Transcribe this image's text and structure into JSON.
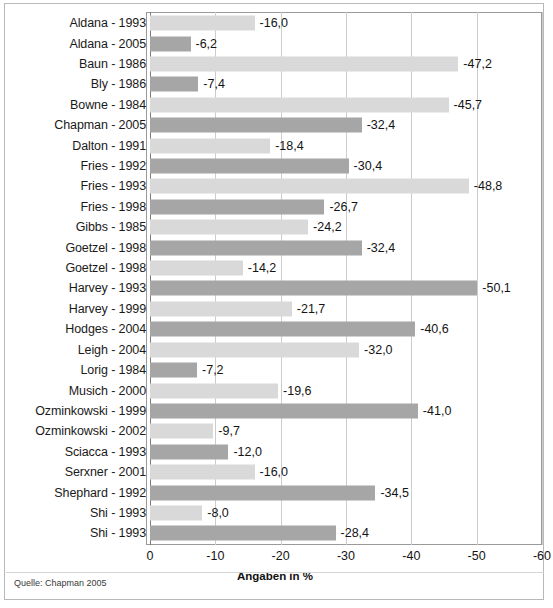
{
  "figure": {
    "source_note": "Quelle: Chapman 2005",
    "axis_title": "Angaben in %"
  },
  "chart_data": {
    "type": "bar",
    "orientation": "horizontal",
    "title": "",
    "subtitle": "",
    "xlabel": "Angaben in %",
    "ylabel": "",
    "xlim": [
      0,
      -60
    ],
    "xticks": [
      0,
      -10,
      -20,
      -30,
      -40,
      -50,
      -60
    ],
    "xtick_labels": [
      "0",
      "-10",
      "-20",
      "-30",
      "-40",
      "-50",
      "-60"
    ],
    "grid": true,
    "legend": null,
    "value_label_format": "comma-decimal",
    "colors": {
      "bar_light": "#d9d9d9",
      "bar_dark": "#a6a6a6",
      "gridline": "#cccccc",
      "frame": "#9a9a9a",
      "text": "#141414"
    },
    "categories": [
      "Aldana - 1993",
      "Aldana - 2005",
      "Baun - 1986",
      "Bly - 1986",
      "Bowne - 1984",
      "Chapman - 2005",
      "Dalton - 1991",
      "Fries - 1992",
      "Fries - 1993",
      "Fries - 1998",
      "Gibbs - 1985",
      "Goetzel - 1998",
      "Goetzel - 1998",
      "Harvey - 1993",
      "Harvey - 1999",
      "Hodges - 2004",
      "Leigh - 2004",
      "Lorig - 1984",
      "Musich - 2000",
      "Ozminkowski - 1999",
      "Ozminkowski - 2002",
      "Sciacca - 1993",
      "Serxner - 2001",
      "Shephard - 1992",
      "Shi - 1993",
      "Shi - 1993"
    ],
    "values": [
      -16.0,
      -6.2,
      -47.2,
      -7.4,
      -45.7,
      -32.4,
      -18.4,
      -30.4,
      -48.8,
      -26.7,
      -24.2,
      -32.4,
      -14.2,
      -50.1,
      -21.7,
      -40.6,
      -32.0,
      -7.2,
      -19.6,
      -41.0,
      -9.7,
      -12.0,
      -16.0,
      -34.5,
      -8.0,
      -28.4
    ],
    "value_labels": [
      "-16,0",
      "-6,2",
      "-47,2",
      "-7,4",
      "-45,7",
      "-32,4",
      "-18,4",
      "-30,4",
      "-48,8",
      "-26,7",
      "-24,2",
      "-32,4",
      "-14,2",
      "-50,1",
      "-21,7",
      "-40,6",
      "-32,0",
      "-7,2",
      "-19,6",
      "-41,0",
      "-9,7",
      "-12,0",
      "-16,0",
      "-34,5",
      "-8,0",
      "-28,4"
    ],
    "bar_shades": [
      "light",
      "dark",
      "light",
      "dark",
      "light",
      "dark",
      "light",
      "dark",
      "light",
      "dark",
      "light",
      "dark",
      "light",
      "dark",
      "light",
      "dark",
      "light",
      "dark",
      "light",
      "dark",
      "light",
      "dark",
      "light",
      "dark",
      "light",
      "dark"
    ]
  }
}
